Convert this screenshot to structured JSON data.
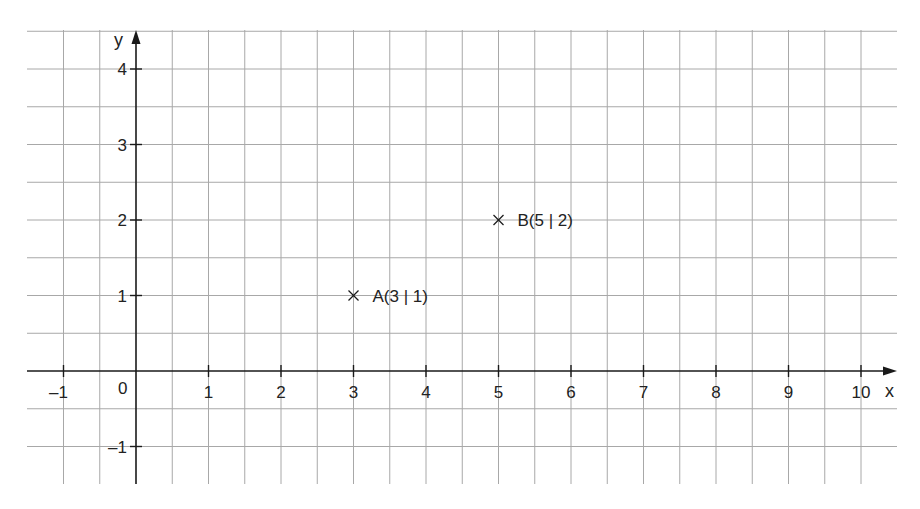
{
  "chart_data": {
    "type": "scatter",
    "title": "",
    "xlabel": "x",
    "ylabel": "y",
    "xlim": [
      -1.5,
      10.5
    ],
    "ylim": [
      -1.5,
      4.5
    ],
    "grid": true,
    "grid_step": 0.5,
    "x_ticks": [
      -1,
      1,
      2,
      3,
      4,
      5,
      6,
      7,
      8,
      9,
      10
    ],
    "x_tick_labels": [
      "–1",
      "1",
      "2",
      "3",
      "4",
      "5",
      "6",
      "7",
      "8",
      "9",
      "10"
    ],
    "y_ticks": [
      4,
      3,
      2,
      1,
      -1
    ],
    "y_tick_labels": [
      "4",
      "3",
      "2",
      "1",
      "–1"
    ],
    "origin_label": "0",
    "points": [
      {
        "name": "A",
        "x": 3,
        "y": 1,
        "label": "A(3 | 1)",
        "marker": "x"
      },
      {
        "name": "B",
        "x": 5,
        "y": 2,
        "label": "B(5 | 2)",
        "marker": "x"
      }
    ]
  },
  "style": {
    "grid_color": "#a8a8a8",
    "axis_color": "#1a1a1a",
    "text_color": "#222222"
  },
  "layout": {
    "origin_px": [
      136,
      371
    ],
    "unit_px": [
      72.5,
      75.5
    ],
    "grid_left": 27,
    "grid_right": 897,
    "grid_top": 30,
    "grid_bottom": 484
  }
}
